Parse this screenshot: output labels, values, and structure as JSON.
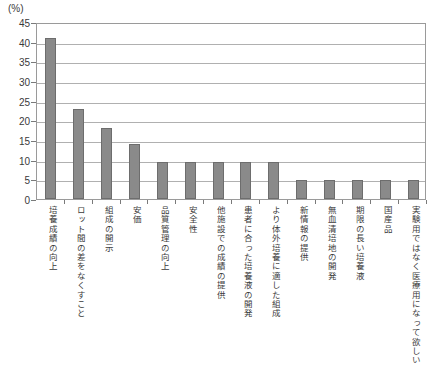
{
  "chart_data": {
    "type": "bar",
    "title": "",
    "subtitle": "",
    "xlabel": "",
    "ylabel": "(%)",
    "unit_label": "(%)",
    "ylim": [
      0,
      45
    ],
    "ytick_step": 5,
    "yticks": [
      "0",
      "5",
      "10",
      "15",
      "20",
      "25",
      "30",
      "35",
      "40",
      "45"
    ],
    "grid": true,
    "legend": "none",
    "orientation": "vertical",
    "bar_color": "#8a8a8a",
    "bar_edge_color": "#6d6d6d",
    "frame_color": "#9a9a9a",
    "gridline_color": "#b0b0b0",
    "categories": [
      "培養成績の向上",
      "ロット間の差をなくすこと",
      "組成の開示",
      "安価",
      "品質管理の向上",
      "安全性",
      "他施設での成績の提供",
      "患者に合った培養液の開発",
      "より体外培養に適した組成",
      "新情報の提供",
      "無血清培地の開発",
      "期限の長い培養液",
      "国産品",
      "実験用ではなく医療用になって欲しい"
    ],
    "values": [
      41,
      23,
      18,
      14,
      9.5,
      9.5,
      9.5,
      9.5,
      9.5,
      4.8,
      4.8,
      4.8,
      4.8,
      4.8
    ]
  }
}
